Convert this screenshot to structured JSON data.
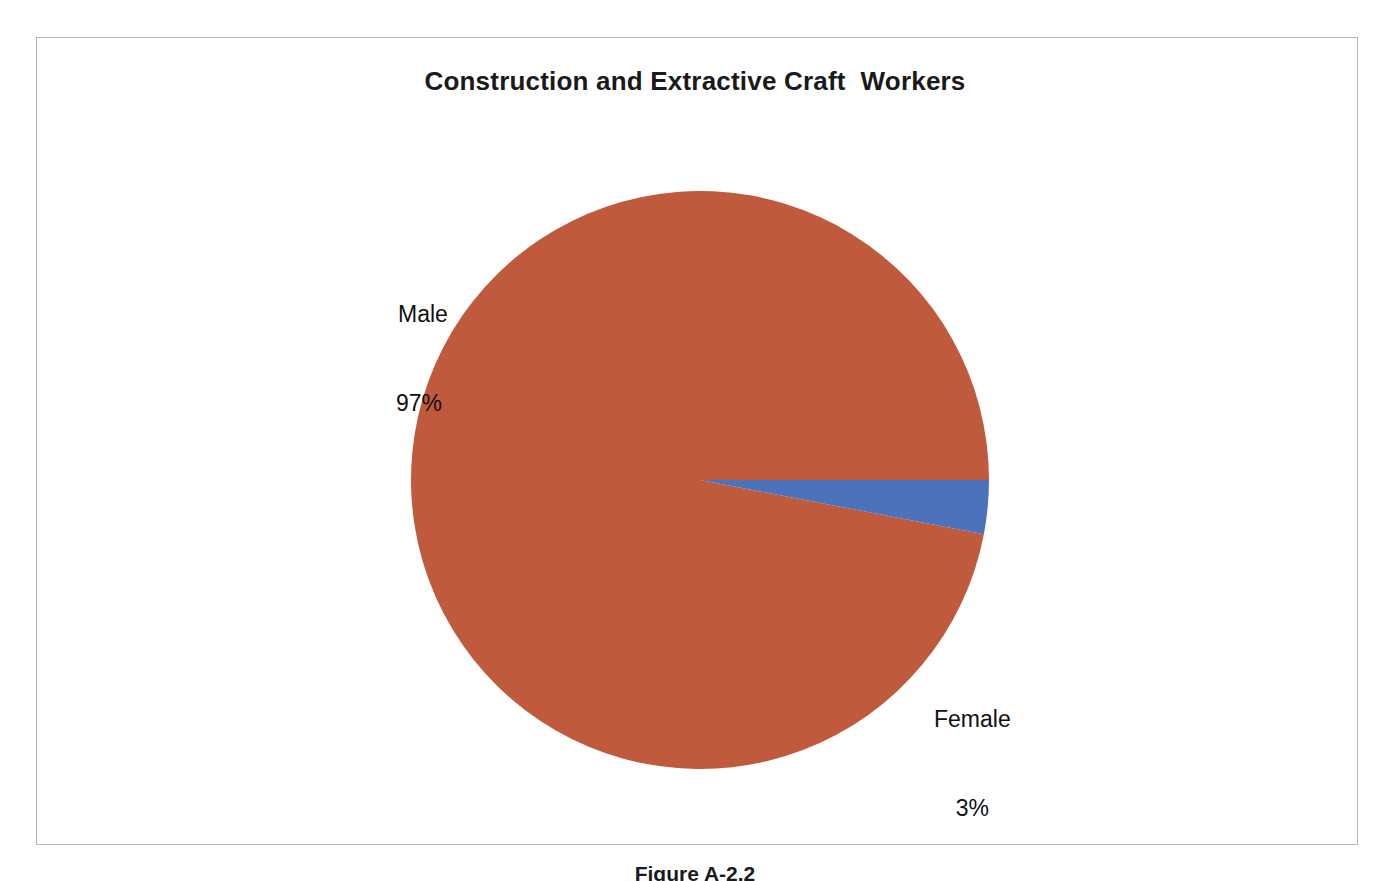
{
  "figure": {
    "frame_border_color": "#b6b6b6",
    "background": "#ffffff",
    "caption": "Figure A-2.2"
  },
  "chart_data": {
    "type": "pie",
    "title": "Construction and Extractive Craft  Workers",
    "subtitle": "",
    "xlabel": "",
    "ylabel": "",
    "legend_position": "none",
    "grid": false,
    "labels_inline": true,
    "unit": "%",
    "categories": [
      "Male",
      "Female"
    ],
    "values": [
      97,
      3
    ],
    "slices": [
      {
        "label": "Male",
        "value": 97,
        "value_text": "97%",
        "color": "#c05a3c",
        "start_angle_deg": 11,
        "end_angle_deg": 360
      },
      {
        "label": "Female",
        "value": 3,
        "value_text": "3%",
        "color": "#4c73ba",
        "start_angle_deg": 0,
        "end_angle_deg": 11
      }
    ],
    "annotations": [
      {
        "name": "male-callout",
        "text": "Male\n97%"
      },
      {
        "name": "female-callout",
        "text": "Female\n3%"
      }
    ]
  },
  "labels": {
    "male": {
      "name": "Male",
      "value": "97%"
    },
    "female": {
      "name": "Female",
      "value": "3%"
    }
  },
  "colors": {
    "male_slice": "#c05a3c",
    "female_slice": "#4c73ba",
    "title_text": "#1a1a1a",
    "label_text": "#111111",
    "frame": "#b6b6b6"
  }
}
